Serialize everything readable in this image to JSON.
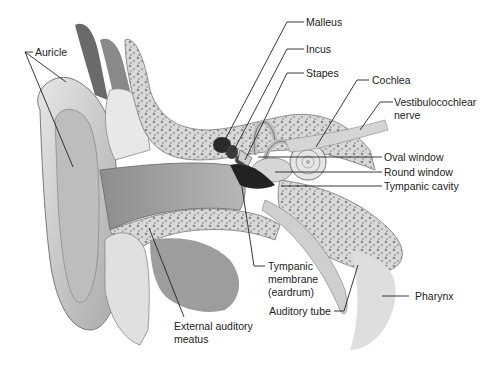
{
  "diagram": {
    "labels": {
      "auricle": "Auricle",
      "malleus": "Malleus",
      "incus": "Incus",
      "stapes": "Stapes",
      "cochlea": "Cochlea",
      "vestibulocochlear_1": "Vestibulocochlear",
      "vestibulocochlear_2": "nerve",
      "oval_window": "Oval window",
      "round_window": "Round window",
      "tympanic_cavity": "Tympanic cavity",
      "tympanic_membrane_1": "Tympanic",
      "tympanic_membrane_2": "membrane",
      "tympanic_membrane_3": "(eardrum)",
      "auditory_tube": "Auditory tube",
      "pharynx": "Pharynx",
      "external_meatus_1": "External auditory",
      "external_meatus_2": "meatus"
    }
  }
}
